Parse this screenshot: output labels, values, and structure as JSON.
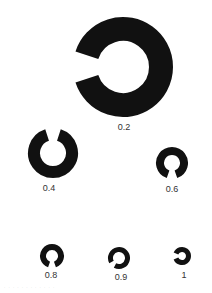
{
  "chart": {
    "optotypes": [
      {
        "acuity": "0.2",
        "gap": "left",
        "cx": 123,
        "cy": 67,
        "r": 50,
        "stroke": 24
      },
      {
        "acuity": "0.4",
        "gap": "top",
        "cx": 53,
        "cy": 153,
        "r": 25,
        "stroke": 12
      },
      {
        "acuity": "0.6",
        "gap": "bottom",
        "cx": 172,
        "cy": 163,
        "r": 16,
        "stroke": 8
      },
      {
        "acuity": "0.8",
        "gap": "bottom",
        "cx": 52,
        "cy": 256,
        "r": 12,
        "stroke": 6
      },
      {
        "acuity": "0.9",
        "gap": "bottom-left",
        "cx": 119,
        "cy": 258,
        "r": 11,
        "stroke": 5
      },
      {
        "acuity": "1",
        "gap": "left",
        "cx": 182,
        "cy": 256,
        "r": 9,
        "stroke": 5
      }
    ]
  },
  "labels": {
    "l0": "0.2",
    "l1": "0.4",
    "l2": "0.6",
    "l3": "0.8",
    "l4": "0.9",
    "l5": "1"
  },
  "colors": {
    "ink": "#111111",
    "background": "#ffffff"
  }
}
